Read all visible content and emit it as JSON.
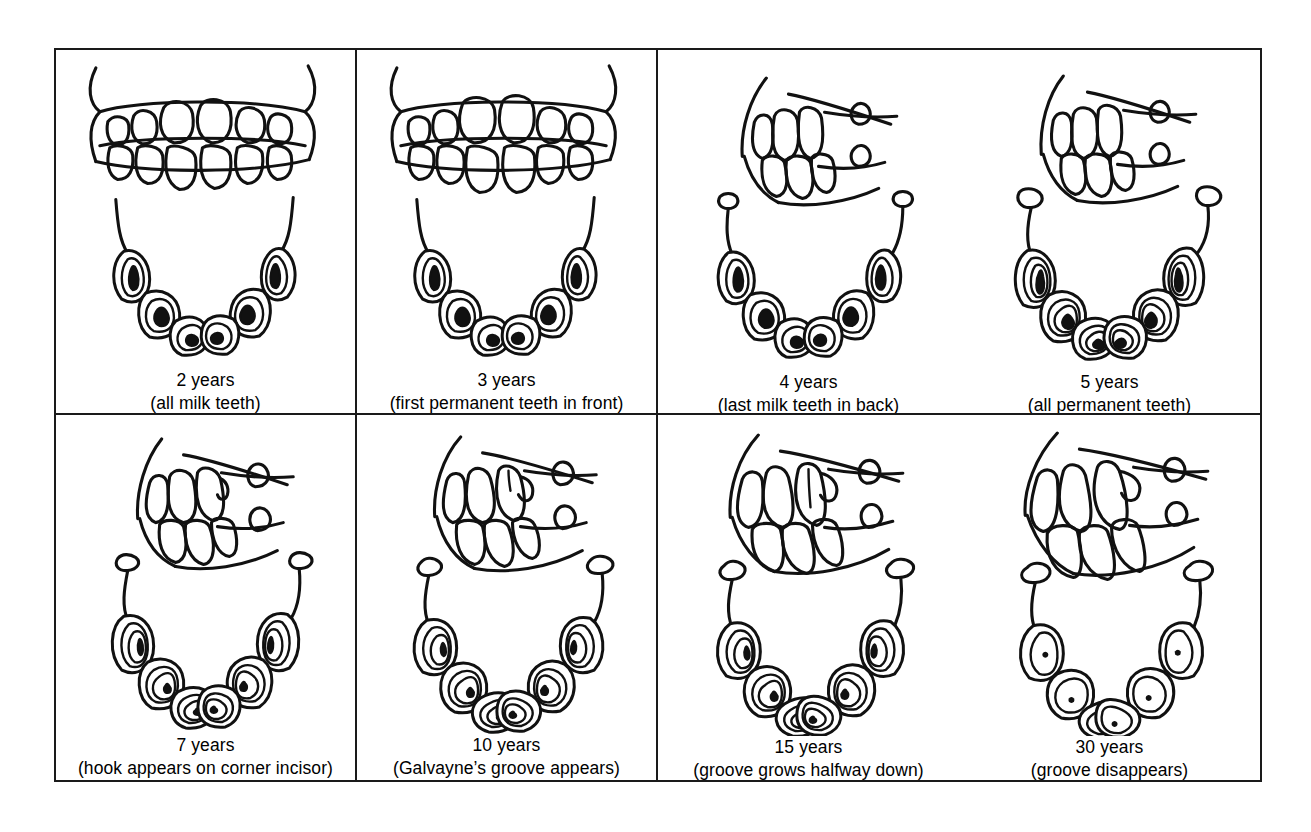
{
  "document": {
    "title": "Horse Teeth Aging Chart",
    "background_color": "#ffffff",
    "ink_color": "#111111",
    "border_color": "#1a1a1a"
  },
  "grid": {
    "columns": 4,
    "rows": 2,
    "cell_count": 8
  },
  "cells": [
    {
      "id": "cell-2-years",
      "age": "2 years",
      "note": "(all milk teeth)",
      "views": [
        "profile-incisors-closed",
        "occlusal-lower-arch"
      ],
      "incisor_count": 6,
      "tushes_visible": false
    },
    {
      "id": "cell-3-years",
      "age": "3 years",
      "note": "(first permanent teeth in front)",
      "views": [
        "profile-incisors-closed",
        "occlusal-lower-arch"
      ],
      "incisor_count": 6,
      "tushes_visible": false
    },
    {
      "id": "cell-4-years",
      "age": "4 years",
      "note": "(last milk teeth in back)",
      "views": [
        "profile-incisors-side",
        "occlusal-lower-arch"
      ],
      "incisor_count": 6,
      "tushes_visible": true
    },
    {
      "id": "cell-5-years",
      "age": "5 years",
      "note": "(all permanent teeth)",
      "views": [
        "profile-incisors-side",
        "occlusal-lower-arch"
      ],
      "incisor_count": 6,
      "tushes_visible": true
    },
    {
      "id": "cell-7-years",
      "age": "7 years",
      "note": "(hook appears on corner incisor)",
      "views": [
        "profile-incisors-side",
        "occlusal-lower-arch"
      ],
      "incisor_count": 6,
      "tushes_visible": true
    },
    {
      "id": "cell-10-years",
      "age": "10 years",
      "note": "(Galvayne’s groove appears)",
      "views": [
        "profile-incisors-side",
        "occlusal-lower-arch"
      ],
      "incisor_count": 6,
      "tushes_visible": true
    },
    {
      "id": "cell-15-years",
      "age": "15 years",
      "note": "(groove grows halfway down)",
      "views": [
        "profile-incisors-side",
        "occlusal-lower-arch"
      ],
      "incisor_count": 6,
      "tushes_visible": true
    },
    {
      "id": "cell-30-years",
      "age": "30 years",
      "note": "(groove disappears)",
      "views": [
        "profile-incisors-side",
        "occlusal-lower-arch"
      ],
      "incisor_count": 6,
      "tushes_visible": true
    }
  ]
}
